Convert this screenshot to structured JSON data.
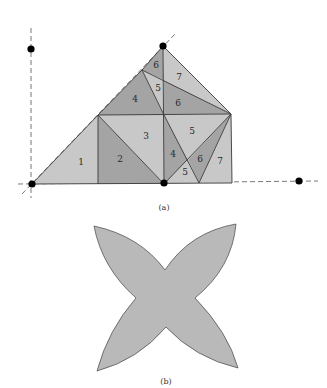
{
  "figure_a": {
    "caption": "(a)",
    "pieces": [
      {
        "label": "1",
        "shade": "light"
      },
      {
        "label": "2",
        "shade": "dark"
      },
      {
        "label": "3",
        "shade": "light"
      },
      {
        "label": "4",
        "shade": "dark"
      },
      {
        "label": "5",
        "shade": "light"
      },
      {
        "label": "6",
        "shade": "dark"
      },
      {
        "label": "7",
        "shade": "light"
      },
      {
        "label": "4",
        "shade": "dark"
      },
      {
        "label": "5",
        "shade": "light"
      },
      {
        "label": "6",
        "shade": "dark"
      },
      {
        "label": "5",
        "shade": "light"
      },
      {
        "label": "6",
        "shade": "dark"
      },
      {
        "label": "7",
        "shade": "light"
      }
    ],
    "colors": {
      "light": "#c8c8c8",
      "dark": "#a4a4a4",
      "lighter": "#d6d6d6",
      "point": "#000000"
    }
  },
  "figure_b": {
    "caption": "(b)",
    "shape": "four-pointed star",
    "fill": "#b9b9b9"
  }
}
